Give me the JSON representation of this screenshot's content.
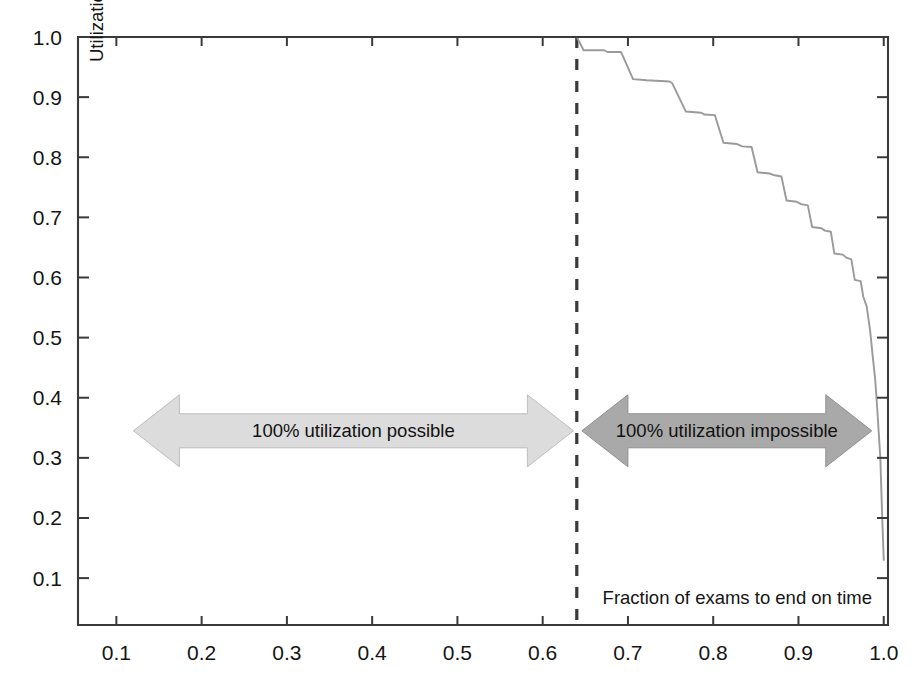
{
  "chart_data": {
    "type": "line",
    "title": "",
    "xlabel": "Fraction of exams to end on time",
    "ylabel": "Utilization",
    "xlim": [
      0.055,
      1.005
    ],
    "ylim": [
      0.022,
      1.0
    ],
    "grid": false,
    "legend_position": "none",
    "xticks": [
      "0.1",
      "0.2",
      "0.3",
      "0.4",
      "0.5",
      "0.6",
      "0.7",
      "0.8",
      "0.9",
      "1.0"
    ],
    "xtick_values": [
      0.1,
      0.2,
      0.3,
      0.4,
      0.5,
      0.6,
      0.7,
      0.8,
      0.9,
      1.0
    ],
    "yticks": [
      "0.1",
      "0.2",
      "0.3",
      "0.4",
      "0.5",
      "0.6",
      "0.7",
      "0.8",
      "0.9",
      "1.0"
    ],
    "ytick_values": [
      0.1,
      0.2,
      0.3,
      0.4,
      0.5,
      0.6,
      0.7,
      0.8,
      0.9,
      1.0
    ],
    "series": [
      {
        "name": "utilization-frontier",
        "style": "step-declining",
        "color": "#9a9a9a",
        "points": [
          [
            0.64,
            1.0
          ],
          [
            0.648,
            0.978
          ],
          [
            0.672,
            0.978
          ],
          [
            0.676,
            0.975
          ],
          [
            0.692,
            0.975
          ],
          [
            0.706,
            0.93
          ],
          [
            0.722,
            0.928
          ],
          [
            0.749,
            0.926
          ],
          [
            0.752,
            0.923
          ],
          [
            0.768,
            0.876
          ],
          [
            0.786,
            0.874
          ],
          [
            0.79,
            0.871
          ],
          [
            0.802,
            0.87
          ],
          [
            0.812,
            0.824
          ],
          [
            0.828,
            0.822
          ],
          [
            0.834,
            0.818
          ],
          [
            0.845,
            0.817
          ],
          [
            0.852,
            0.775
          ],
          [
            0.866,
            0.773
          ],
          [
            0.872,
            0.77
          ],
          [
            0.88,
            0.768
          ],
          [
            0.886,
            0.728
          ],
          [
            0.898,
            0.726
          ],
          [
            0.903,
            0.722
          ],
          [
            0.911,
            0.72
          ],
          [
            0.916,
            0.684
          ],
          [
            0.927,
            0.682
          ],
          [
            0.931,
            0.678
          ],
          [
            0.938,
            0.676
          ],
          [
            0.942,
            0.64
          ],
          [
            0.952,
            0.638
          ],
          [
            0.956,
            0.633
          ],
          [
            0.962,
            0.63
          ],
          [
            0.966,
            0.596
          ],
          [
            0.973,
            0.594
          ],
          [
            0.976,
            0.568
          ],
          [
            0.98,
            0.552
          ],
          [
            0.984,
            0.512
          ],
          [
            0.987,
            0.47
          ],
          [
            0.99,
            0.43
          ],
          [
            0.992,
            0.39
          ],
          [
            0.994,
            0.345
          ],
          [
            0.996,
            0.3
          ],
          [
            0.997,
            0.255
          ],
          [
            0.998,
            0.21
          ],
          [
            0.999,
            0.17
          ],
          [
            1.0,
            0.13
          ]
        ]
      }
    ],
    "reference_lines": [
      {
        "name": "threshold",
        "orientation": "vertical",
        "value": 0.64,
        "style": "dashed",
        "color": "#3a3a3a"
      }
    ],
    "annotations": [
      {
        "name": "utilization-possible",
        "text": "100% utilization possible",
        "shape": "double-arrow",
        "x_start": 0.12,
        "x_end": 0.636,
        "y": 0.345,
        "fill": "#dcdcdc",
        "stroke": "#bdbdbd"
      },
      {
        "name": "utilization-impossible",
        "text": "100% utilization impossible",
        "shape": "double-arrow",
        "x_start": 0.646,
        "x_end": 0.986,
        "y": 0.345,
        "fill": "#a9a9a9",
        "stroke": "#8f8f8f"
      }
    ]
  },
  "axes": {
    "y_axis_title": "Utilization",
    "x_axis_title": "Fraction of exams to end on time",
    "frame_color": "#3a3a3a"
  }
}
